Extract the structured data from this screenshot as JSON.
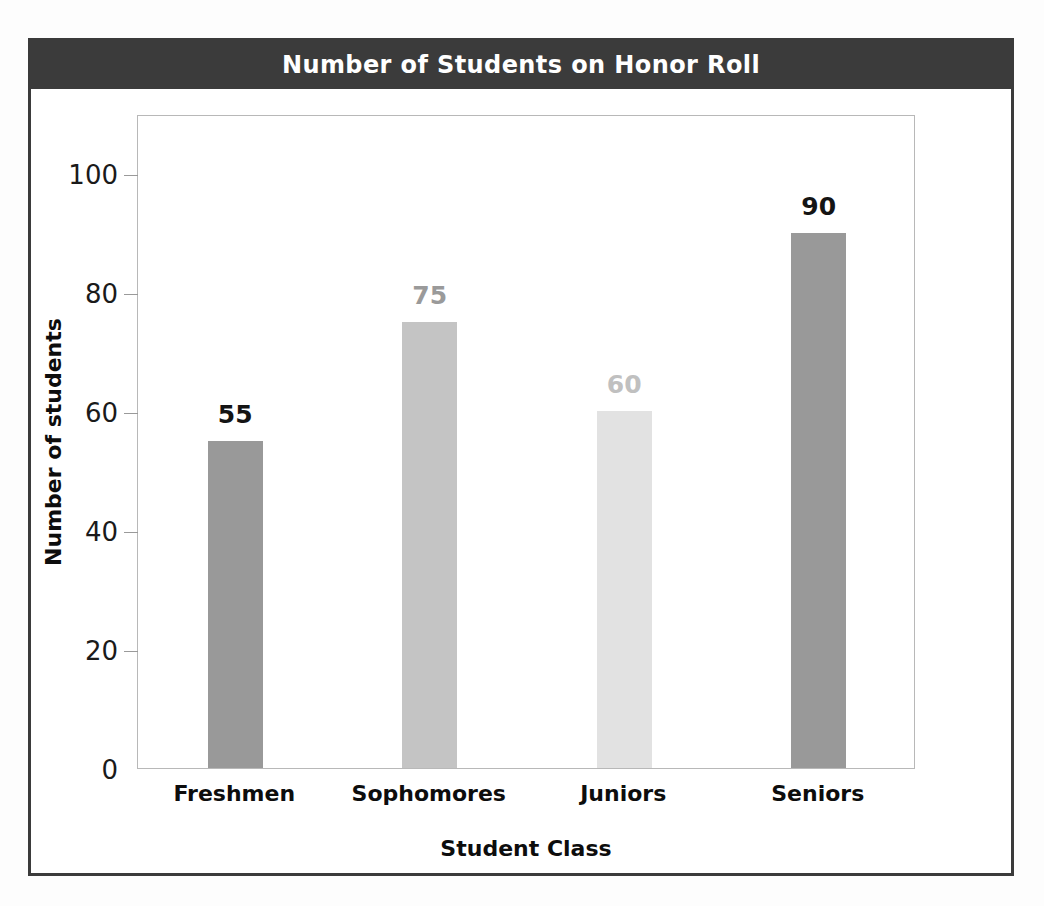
{
  "chart_data": {
    "type": "bar",
    "title": "Number of Students on Honor Roll",
    "xlabel": "Student Class",
    "ylabel": "Number of students",
    "categories": [
      "Freshmen",
      "Sophomores",
      "Juniors",
      "Seniors"
    ],
    "values": [
      55,
      75,
      60,
      90
    ],
    "value_labels": [
      "55",
      "75",
      "60",
      "90"
    ],
    "bar_colors": [
      "#999999",
      "#c4c4c4",
      "#e2e2e2",
      "#999999"
    ],
    "label_colors": [
      "#141414",
      "#9a9a9a",
      "#c0c0c0",
      "#141414"
    ],
    "ylim": [
      0,
      110
    ],
    "yticks": [
      0,
      20,
      40,
      60,
      80,
      100
    ],
    "ytick_labels": [
      "0",
      "20",
      "40",
      "60",
      "80",
      "100"
    ],
    "grid": false,
    "legend": "none",
    "title_background": "#3b3b3b",
    "title_color": "#ffffff",
    "frame_color": "#3b3b3b",
    "plot_border_color": "#b8b8b8"
  }
}
